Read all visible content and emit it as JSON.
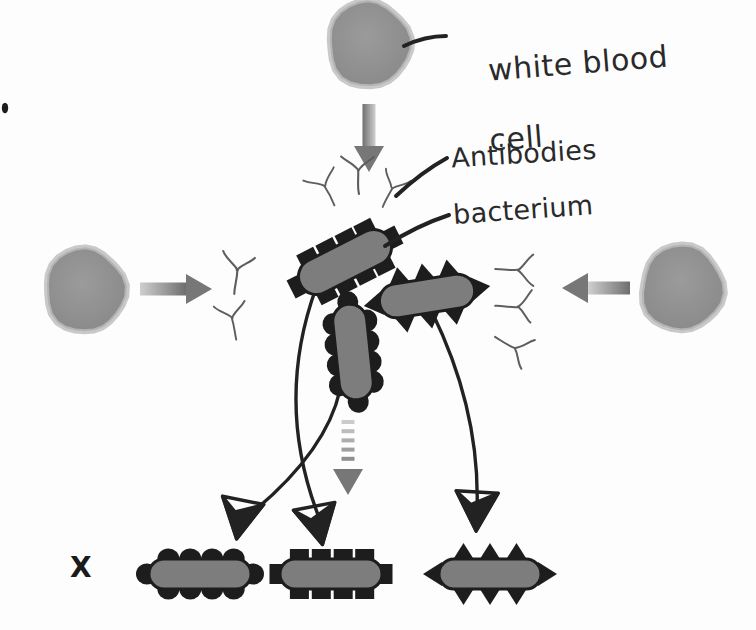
{
  "page": {
    "background_color": "#fdfdfd",
    "width": 756,
    "height": 630
  },
  "palette": {
    "ink": "#222222",
    "cell_fill": "#8f8f8f",
    "cell_ring": "#c9c9c9",
    "bacterium_fill": "#7d7d7d",
    "bacterium_outline": "#1d1d1d",
    "arrow_gray": "#8a8a8a",
    "antibody_ink": "#5e5e5e",
    "label_ink": "#2a2a2a"
  },
  "labels": {
    "white_blood_cell": {
      "line1": "white blood",
      "line2": "cell"
    },
    "antibodies": "Antibodies",
    "bacterium": "bacterium",
    "cross_mark": "X"
  },
  "white_blood_cells": [
    {
      "id": "top",
      "name": "white-blood-cell-top",
      "cx": 369,
      "cy": 44,
      "rx": 40,
      "ry": 42,
      "rotate": -8
    },
    {
      "id": "left",
      "name": "white-blood-cell-left",
      "cx": 85,
      "cy": 290,
      "rx": 39,
      "ry": 41,
      "rotate": -6
    },
    {
      "id": "right",
      "name": "white-blood-cell-right",
      "cx": 682,
      "cy": 288,
      "rx": 40,
      "ry": 42,
      "rotate": 7
    }
  ],
  "arrows": [
    {
      "id": "top-down",
      "name": "arrow-top-downward",
      "direction": "down",
      "style": "solid-gradient",
      "from": [
        369,
        104
      ],
      "to": [
        369,
        172
      ]
    },
    {
      "id": "left-right",
      "name": "arrow-left-rightward",
      "direction": "right",
      "style": "solid-gradient",
      "from": [
        140,
        289
      ],
      "to": [
        212,
        289
      ]
    },
    {
      "id": "right-left",
      "name": "arrow-right-leftward",
      "direction": "left",
      "style": "solid-gradient",
      "from": [
        630,
        288
      ],
      "to": [
        562,
        288
      ]
    },
    {
      "id": "center-down-dashed",
      "name": "arrow-center-downward-dashed",
      "direction": "down",
      "style": "dashed-gradient",
      "from": [
        348,
        420
      ],
      "to": [
        348,
        495
      ]
    }
  ],
  "antibody_groups": [
    {
      "id": "top-cluster",
      "name": "antibody-group-top",
      "count": 3,
      "orientation": "upright",
      "items": [
        {
          "x": 358,
          "y": 170,
          "rotate": 0,
          "scale": 1.0
        },
        {
          "x": 325,
          "y": 186,
          "rotate": -28,
          "scale": 0.9
        },
        {
          "x": 392,
          "y": 188,
          "rotate": 26,
          "scale": 0.88
        }
      ]
    },
    {
      "id": "left-pair",
      "name": "antibody-group-left",
      "count": 2,
      "orientation": "upright",
      "items": [
        {
          "x": 237,
          "y": 270,
          "rotate": 8,
          "scale": 1.0
        },
        {
          "x": 232,
          "y": 318,
          "rotate": -12,
          "scale": 0.92
        }
      ]
    },
    {
      "id": "right-triple",
      "name": "antibody-group-right",
      "count": 3,
      "orientation": "rotated",
      "items": [
        {
          "x": 518,
          "y": 270,
          "rotate": 92,
          "scale": 0.95
        },
        {
          "x": 518,
          "y": 307,
          "rotate": 92,
          "scale": 0.95
        },
        {
          "x": 515,
          "y": 348,
          "rotate": 118,
          "scale": 0.95
        }
      ]
    }
  ],
  "bacteria_center": [
    {
      "id": "upper-left",
      "name": "bacterium-upper-left",
      "surface": "square-bumps",
      "cx": 345,
      "cy": 262,
      "length": 100,
      "thickness": 36,
      "rotate": -27
    },
    {
      "id": "middle-vertical",
      "name": "bacterium-middle-vertical",
      "surface": "round-bumps",
      "cx": 353,
      "cy": 352,
      "length": 96,
      "thickness": 34,
      "rotate": 84
    },
    {
      "id": "right-spiked",
      "name": "bacterium-right-spiked",
      "surface": "triangular-spikes",
      "cx": 427,
      "cy": 296,
      "length": 96,
      "thickness": 34,
      "rotate": -9
    }
  ],
  "bacteria_legend_row": [
    {
      "id": "legend-round",
      "name": "bacterium-legend-round-bumps",
      "surface": "round-bumps",
      "cx": 200,
      "cy": 574,
      "length": 102,
      "thickness": 30
    },
    {
      "id": "legend-square",
      "name": "bacterium-legend-square-bumps",
      "surface": "square-bumps",
      "cx": 331,
      "cy": 574,
      "length": 102,
      "thickness": 30
    },
    {
      "id": "legend-spiked",
      "name": "bacterium-legend-triangular-spikes",
      "surface": "triangular-spikes",
      "cx": 490,
      "cy": 574,
      "length": 102,
      "thickness": 30
    }
  ],
  "connector_lines": [
    {
      "id": "conn-1",
      "name": "connector-upper-left-to-legend-square",
      "from": [
        316,
        288
      ],
      "to": [
        320,
        520
      ]
    },
    {
      "id": "conn-2",
      "name": "connector-middle-to-legend-round",
      "from": [
        340,
        390
      ],
      "to": [
        243,
        520
      ]
    },
    {
      "id": "conn-3",
      "name": "connector-right-spiked-to-legend-spiked",
      "from": [
        432,
        312
      ],
      "to": [
        477,
        510
      ]
    }
  ],
  "arrowheads": [
    {
      "id": "head-1",
      "name": "arrowhead-legend-round",
      "x": 239,
      "y": 521,
      "rotate": 14
    },
    {
      "id": "head-2",
      "name": "arrowhead-legend-square",
      "x": 318,
      "y": 527,
      "rotate": -8
    },
    {
      "id": "head-3",
      "name": "arrowhead-legend-spiked",
      "x": 476,
      "y": 513,
      "rotate": 6
    }
  ],
  "leader_lines": [
    {
      "id": "leader-wbc",
      "name": "leader-line-white-blood-cell",
      "from": [
        404,
        46
      ],
      "to": [
        446,
        36
      ]
    },
    {
      "id": "leader-antibodies",
      "name": "leader-line-antibodies",
      "from": [
        396,
        196
      ],
      "to": [
        447,
        158
      ]
    },
    {
      "id": "leader-bacterium",
      "name": "leader-line-bacterium",
      "from": [
        385,
        246
      ],
      "to": [
        449,
        215
      ]
    }
  ]
}
